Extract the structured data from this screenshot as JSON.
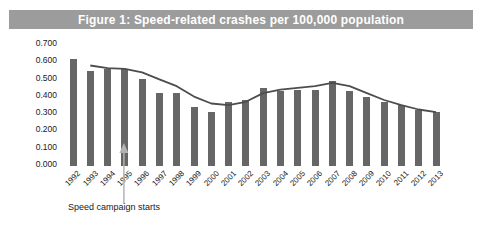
{
  "title": "Figure 1: Speed-related crashes per 100,000 population",
  "colors": {
    "title_bar_bg": "#9c9c9c",
    "title_text": "#ffffff",
    "bar": "#666666",
    "trend_line": "#4d4d4d",
    "arrow": "#b3b3b3",
    "axis_text": "#1a1a1a",
    "background": "#ffffff"
  },
  "annotation": {
    "label": "Speed campaign starts",
    "arrow_points_between": [
      "1995",
      "1996"
    ]
  },
  "chart_data": {
    "type": "bar",
    "title": "Figure 1: Speed-related crashes per 100,000 population",
    "categories": [
      "1992",
      "1993",
      "1994",
      "1995",
      "1996",
      "1997",
      "1998",
      "1999",
      "2000",
      "2001",
      "2002",
      "2003",
      "2004",
      "2005",
      "2006",
      "2007",
      "2008",
      "2009",
      "2010",
      "2011",
      "2012",
      "2013"
    ],
    "series": [
      {
        "name": "Speed-related crashes per 100,000 population",
        "type": "bar",
        "values": [
          0.61,
          0.54,
          0.55,
          0.55,
          0.49,
          0.41,
          0.41,
          0.33,
          0.3,
          0.36,
          0.37,
          0.44,
          0.42,
          0.43,
          0.43,
          0.48,
          0.42,
          0.39,
          0.36,
          0.34,
          0.31,
          0.3
        ]
      },
      {
        "name": "Trend",
        "type": "line",
        "values": [
          null,
          0.57,
          0.555,
          0.55,
          0.53,
          0.49,
          0.45,
          0.39,
          0.35,
          0.34,
          0.36,
          0.41,
          0.43,
          0.44,
          0.45,
          0.47,
          0.45,
          0.41,
          0.37,
          0.34,
          0.315,
          0.3
        ]
      }
    ],
    "xlabel": "",
    "ylabel": "",
    "ylim": [
      0,
      0.7
    ],
    "ytick_step": 0.1,
    "ytick_decimals": 3,
    "grid": false,
    "legend": "none",
    "annotations": [
      {
        "text": "Speed campaign starts",
        "arrow": true,
        "target_x": "between 1995 and 1996"
      }
    ]
  }
}
